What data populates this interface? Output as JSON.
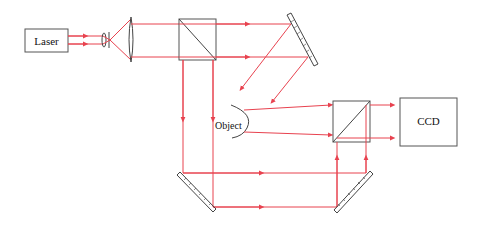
{
  "diagram": {
    "type": "optical-setup-schematic",
    "colors": {
      "beam": "#e8424f",
      "component_outline": "#444444",
      "background": "#ffffff"
    },
    "components": {
      "laser": {
        "label": "Laser"
      },
      "object": {
        "label": "Object"
      },
      "ccd": {
        "label": "CCD"
      },
      "collimating_lens": {
        "label": ""
      },
      "spatial_filter": {
        "label": ""
      },
      "beam_splitter_1": {
        "label": ""
      },
      "beam_splitter_2": {
        "label": ""
      },
      "mirror_1": {
        "label": ""
      },
      "mirror_2": {
        "label": ""
      },
      "mirror_3": {
        "label": ""
      }
    }
  }
}
